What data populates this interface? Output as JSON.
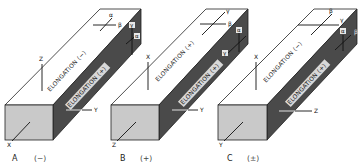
{
  "figure": {
    "panels": [
      {
        "id": "A",
        "caption_letter": "A",
        "caption_sign": "(−)",
        "top_elongation_label": "ELONGATION (−)",
        "side_elongation_label": "ELONGATION (+)",
        "top_vertical_axis": "Z",
        "front_axis": "X",
        "side_axis": "Y",
        "top_cross_labels": [
          "α",
          "β"
        ],
        "side_cross_labels": [
          "γ",
          "α"
        ]
      },
      {
        "id": "B",
        "caption_letter": "B",
        "caption_sign": "(+)",
        "top_elongation_label": "ELONGATION (+)",
        "side_elongation_label": "ELONGATION (+)",
        "top_vertical_axis": "X",
        "front_axis": "Z",
        "side_axis": "Y",
        "top_cross_labels": [
          "γ",
          "β"
        ],
        "side_cross_labels": [
          "α",
          "γ"
        ]
      },
      {
        "id": "C",
        "caption_letter": "C",
        "caption_sign": "(±)",
        "top_elongation_label": "ELONGATION (−)",
        "side_elongation_label": "ELONGATION (+)",
        "top_vertical_axis": "X",
        "front_axis": "Y",
        "side_axis": "Z",
        "top_cross_labels": [
          "β",
          "γ"
        ],
        "side_cross_labels": [
          "α",
          "β"
        ]
      }
    ],
    "colors": {
      "top_face": "#ffffff",
      "front_face": "#c9c9c9",
      "side_face": "#4a4a4a",
      "line": "#111111"
    }
  }
}
